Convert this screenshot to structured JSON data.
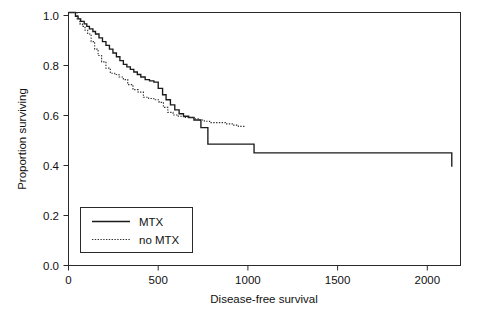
{
  "chart_data": {
    "type": "line",
    "title": "",
    "xlabel": "Disease-free survival",
    "ylabel": "Proportion surviving",
    "xlim": [
      0,
      2250
    ],
    "ylim": [
      0.0,
      1.0
    ],
    "grid": false,
    "legend_position": "bottom-left",
    "xticks": [
      0,
      500,
      1000,
      1500,
      2000
    ],
    "xticklabels": [
      "0",
      "500",
      "1000",
      "1500",
      "2000"
    ],
    "yticks": [
      0.0,
      0.2,
      0.4,
      0.6,
      0.8,
      1.0
    ],
    "yticklabels": [
      "0.0",
      "0.2",
      "0.4",
      "0.6",
      "0.8",
      "1.0"
    ],
    "series": [
      {
        "name": "MTX",
        "style": "solid",
        "color": "#1a1a1a",
        "x": [
          0,
          25,
          40,
          55,
          70,
          90,
          105,
          120,
          140,
          155,
          175,
          195,
          215,
          235,
          255,
          275,
          295,
          315,
          335,
          355,
          375,
          395,
          415,
          440,
          465,
          490,
          515,
          540,
          560,
          585,
          610,
          635,
          660,
          690,
          720,
          760,
          800,
          1065,
          2180,
          2200
        ],
        "y": [
          1.0,
          1.0,
          0.985,
          0.975,
          0.965,
          0.955,
          0.945,
          0.935,
          0.925,
          0.915,
          0.9,
          0.885,
          0.87,
          0.855,
          0.84,
          0.825,
          0.81,
          0.795,
          0.785,
          0.775,
          0.765,
          0.755,
          0.745,
          0.735,
          0.73,
          0.725,
          0.7,
          0.675,
          0.655,
          0.635,
          0.615,
          0.6,
          0.59,
          0.585,
          0.575,
          0.545,
          0.48,
          0.445,
          0.445,
          0.39
        ]
      },
      {
        "name": "no MTX",
        "style": "dotted",
        "color": "#333333",
        "x": [
          0,
          30,
          50,
          65,
          80,
          95,
          110,
          130,
          150,
          170,
          190,
          215,
          240,
          265,
          290,
          315,
          340,
          370,
          400,
          430,
          460,
          490,
          520,
          545,
          570,
          600,
          630,
          660,
          690,
          720,
          750,
          780,
          810,
          840,
          870,
          900,
          940,
          975,
          1010
        ],
        "y": [
          1.0,
          1.0,
          0.975,
          0.955,
          0.945,
          0.93,
          0.915,
          0.885,
          0.855,
          0.83,
          0.805,
          0.78,
          0.76,
          0.755,
          0.745,
          0.735,
          0.715,
          0.695,
          0.685,
          0.665,
          0.66,
          0.655,
          0.645,
          0.625,
          0.605,
          0.595,
          0.59,
          0.585,
          0.585,
          0.58,
          0.575,
          0.57,
          0.565,
          0.565,
          0.565,
          0.56,
          0.555,
          0.55,
          0.545
        ]
      }
    ],
    "legend_entries": [
      {
        "label": "MTX",
        "style": "solid"
      },
      {
        "label": "no MTX",
        "style": "dotted"
      }
    ]
  }
}
